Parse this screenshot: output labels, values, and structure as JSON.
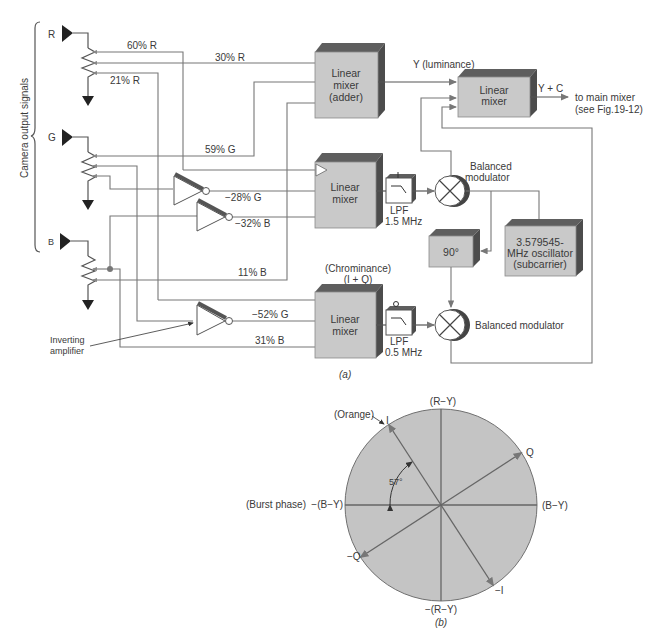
{
  "figure_a": {
    "caption": "(a)",
    "side_label": "Camera output signals",
    "inputs": [
      {
        "id": "R",
        "label": "R"
      },
      {
        "id": "G",
        "label": "G"
      },
      {
        "id": "B",
        "label": "B"
      }
    ],
    "signal_labels": {
      "r60": "60% R",
      "r30": "30% R",
      "r21": "21% R",
      "g59": "59% G",
      "g28": "−28% G",
      "b32": "−32% B",
      "b11": "11% B",
      "g52": "−52% G",
      "b31": "31% B"
    },
    "blocks": {
      "adder": [
        "Linear",
        "mixer",
        "(adder)"
      ],
      "mixer_i": [
        "Linear",
        "mixer"
      ],
      "mixer_q": [
        "Linear",
        "mixer"
      ],
      "mixer_out": [
        "Linear",
        "mixer"
      ],
      "phase": "90°",
      "oscillator": [
        "3.579545-",
        "MHz oscillator",
        "(subcarrier)"
      ]
    },
    "filters": {
      "lpf_i": [
        "LPF",
        "1.5 MHz"
      ],
      "lpf_q": [
        "LPF",
        "0.5 MHz"
      ]
    },
    "annotations": {
      "luminance": "Y (luminance)",
      "output": "Y + C",
      "to_main": "to main mixer",
      "see_fig": "(see Fig.19-12)",
      "bal_mod_top_1": "Balanced",
      "bal_mod_top_2": "modulator",
      "bal_mod_bottom": "Balanced modulator",
      "chrominance_1": "(Chrominance)",
      "chrominance_2": "(I + Q)",
      "inverting_1": "Inverting",
      "inverting_2": "amplifier"
    }
  },
  "figure_b": {
    "caption": "(b)",
    "axes": {
      "r_y": "(R−Y)",
      "neg_r_y": "−(R−Y)",
      "b_y": "(B−Y)",
      "neg_b_y": "−(B−Y)",
      "i": "I",
      "neg_i": "−I",
      "q": "Q",
      "neg_q": "−Q"
    },
    "burst": "(Burst phase)",
    "orange": "(Orange)",
    "angle_label": "57°",
    "i_angle_from_neg_b_y_deg": 57
  }
}
